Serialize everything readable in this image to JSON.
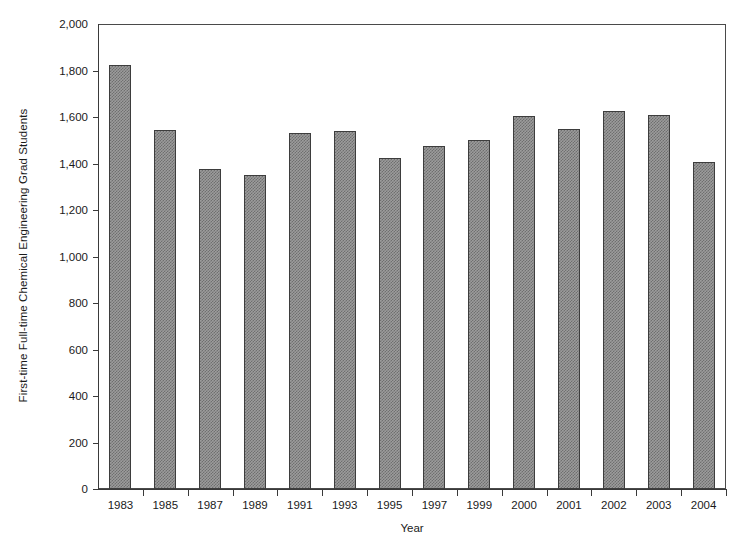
{
  "chart_data": {
    "type": "bar",
    "title": "",
    "xlabel": "Year",
    "ylabel": "First-time Full-time Chemical Engineering Grad Students",
    "categories": [
      "1983",
      "1985",
      "1987",
      "1989",
      "1991",
      "1993",
      "1995",
      "1997",
      "1999",
      "2000",
      "2001",
      "2002",
      "2003",
      "2004"
    ],
    "values": [
      1825,
      1545,
      1375,
      1350,
      1530,
      1540,
      1425,
      1475,
      1500,
      1605,
      1550,
      1625,
      1610,
      1405
    ],
    "ylim": [
      0,
      2000
    ],
    "ytick_labels": [
      "0",
      "200",
      "400",
      "600",
      "800",
      "1,000",
      "1,200",
      "1,400",
      "1,600",
      "1,800",
      "2,000"
    ],
    "ytick_values": [
      0,
      200,
      400,
      600,
      800,
      1000,
      1200,
      1400,
      1600,
      1800,
      2000
    ],
    "grid": false,
    "legend": false,
    "legend_position": "none",
    "bar_fill_color": "#9c9c9c",
    "bar_pattern": "checkered-hatch",
    "bar_border_color": "#3d3d3d",
    "axis_color": "#3a3a3a",
    "background_color": "#ffffff"
  }
}
